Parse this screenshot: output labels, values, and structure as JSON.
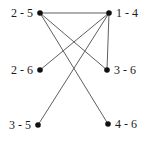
{
  "graph": {
    "title": "",
    "background_color": "#ffffff",
    "node_color": "#111111",
    "edge_color": "#5f5f5f",
    "label_color": "#1c1c1c",
    "node_radius": 2.8,
    "edge_width": 1,
    "nodes": [
      {
        "id": "2-5",
        "label": "2 - 5",
        "x": 40,
        "y": 13,
        "label_side": "left"
      },
      {
        "id": "1-4",
        "label": "1 - 4",
        "x": 109,
        "y": 13,
        "label_side": "right"
      },
      {
        "id": "2-6",
        "label": "2 - 6",
        "x": 40,
        "y": 70,
        "label_side": "left"
      },
      {
        "id": "3-6",
        "label": "3 - 6",
        "x": 107,
        "y": 70,
        "label_side": "right"
      },
      {
        "id": "3-5",
        "label": "3 - 5",
        "x": 38,
        "y": 125,
        "label_side": "left"
      },
      {
        "id": "4-6",
        "label": "4 - 6",
        "x": 108,
        "y": 124,
        "label_side": "right"
      }
    ],
    "edges": [
      {
        "from": "2-5",
        "to": "1-4"
      },
      {
        "from": "2-5",
        "to": "3-6"
      },
      {
        "from": "2-5",
        "to": "4-6"
      },
      {
        "from": "1-4",
        "to": "2-6"
      },
      {
        "from": "1-4",
        "to": "3-5"
      },
      {
        "from": "1-4",
        "to": "3-6"
      }
    ]
  }
}
